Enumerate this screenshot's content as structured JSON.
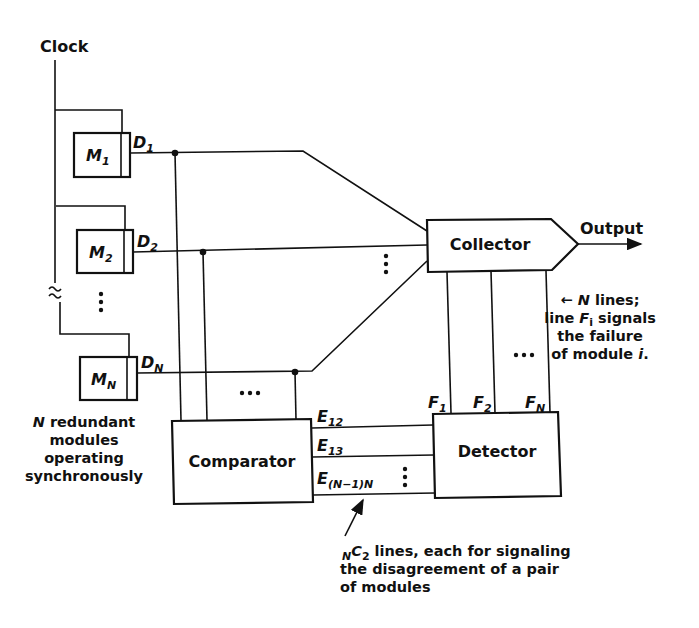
{
  "diagram": {
    "clock": {
      "label": "Clock"
    },
    "modules": [
      {
        "label": "M",
        "sub": "1",
        "output": "D",
        "output_sub": "1"
      },
      {
        "label": "M",
        "sub": "2",
        "output": "D",
        "output_sub": "2"
      },
      {
        "label": "M",
        "sub": "N",
        "output": "D",
        "output_sub": "N"
      }
    ],
    "modules_caption": [
      "N redundant",
      "modules",
      "operating",
      "synchronously"
    ],
    "modules_caption_italic": "N",
    "modules_caption_rest": " redundant",
    "collector": {
      "label": "Collector",
      "output_label": "Output"
    },
    "comparator": {
      "label": "Comparator"
    },
    "detector": {
      "label": "Detector"
    },
    "comparator_outputs": [
      {
        "label": "E",
        "sub": "12"
      },
      {
        "label": "E",
        "sub": "13"
      },
      {
        "label": "E",
        "sub": "(N−1)N"
      }
    ],
    "detector_outputs": [
      {
        "label": "F",
        "sub": "1"
      },
      {
        "label": "F",
        "sub": "2"
      },
      {
        "label": "F",
        "sub": "N"
      }
    ],
    "f_lines_note": {
      "arrow": "←",
      "line1_italic": "N",
      "line1_rest": " lines;",
      "line2_pre": "line ",
      "line2_italic": "F",
      "line2_sub": "i",
      "line2_post": " signals",
      "line3": "the failure",
      "line4_pre": "of module ",
      "line4_italic": "i",
      "line4_post": "."
    },
    "e_lines_note": {
      "prefix_sub": "N",
      "prefix": "C",
      "prefix_sub2": "2",
      "line1_rest": " lines, each for signaling",
      "line2": "the disagreement of a pair",
      "line3": "of modules"
    },
    "ellipsis": "…",
    "vertical_ellipsis": "⋮"
  }
}
